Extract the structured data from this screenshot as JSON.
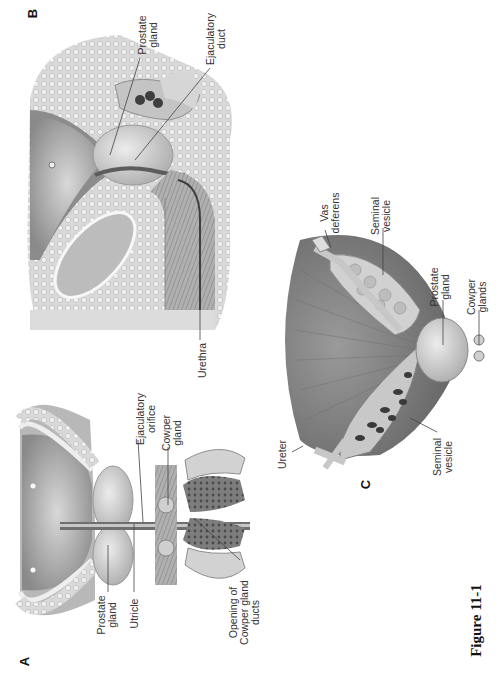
{
  "figure": {
    "caption_fragment": "Figure 11-1",
    "orientation": "rotated 90° counter-clockwise",
    "panels": [
      {
        "id": "A",
        "letter": "A",
        "description": "Coronal section through bladder, prostate and urethra",
        "labels": {
          "prostate_gland": "Prostate gland",
          "prostate_gland_l1": "Prostate",
          "prostate_gland_l2": "gland",
          "utricle": "Utricle",
          "ejaculatory_orifice_l1": "Ejaculatory",
          "ejaculatory_orifice_l2": "orifice",
          "cowper_gland_l1": "Cowper",
          "cowper_gland_l2": "gland",
          "opening_l1": "Opening of",
          "opening_l2": "Cowper gland",
          "opening_l3": "ducts"
        }
      },
      {
        "id": "B",
        "letter": "B",
        "description": "Sagittal section of male pelvis",
        "labels": {
          "prostate_gland_l1": "Prostate",
          "prostate_gland_l2": "gland",
          "ejaculatory_duct_l1": "Ejaculatory",
          "ejaculatory_duct_l2": "duct",
          "urethra": "Urethra"
        }
      },
      {
        "id": "C",
        "letter": "C",
        "description": "Posterior view of bladder, seminal vesicles and prostate",
        "labels": {
          "vas_deferens_l1": "Vas",
          "vas_deferens_l2": "deferens",
          "seminal_vesicle_top_l1": "Seminal",
          "seminal_vesicle_top_l2": "vesicle",
          "prostate_gland_l1": "Prostate",
          "prostate_gland_l2": "gland",
          "cowper_glands_l1": "Cowper",
          "cowper_glands_l2": "glands",
          "ureter": "Ureter",
          "seminal_vesicle_bottom_l1": "Seminal",
          "seminal_vesicle_bottom_l2": "vesicle"
        }
      }
    ]
  }
}
